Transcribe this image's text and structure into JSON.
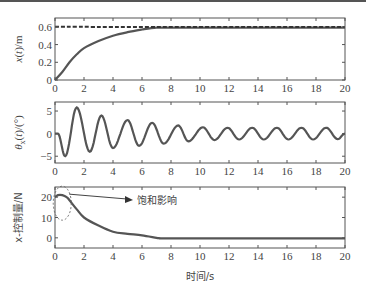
{
  "chart_data": [
    {
      "type": "line",
      "title": "",
      "xlabel": "",
      "ylabel": "x(t)/m",
      "xlim": [
        0,
        20
      ],
      "ylim": [
        0,
        0.7
      ],
      "xticks": [
        "0",
        "2",
        "4",
        "6",
        "8",
        "10",
        "12",
        "14",
        "16",
        "18",
        "20"
      ],
      "yticks": [
        "0",
        "0.2",
        "0.4",
        "0.6"
      ],
      "grid": false,
      "series": [
        {
          "name": "x(t)",
          "style": "solid",
          "x": [
            0,
            0.5,
            1,
            1.5,
            2,
            3,
            4,
            5,
            6,
            7,
            8,
            10,
            12,
            14,
            16,
            18,
            20
          ],
          "y": [
            0,
            0.09,
            0.2,
            0.29,
            0.36,
            0.44,
            0.5,
            0.54,
            0.57,
            0.59,
            0.59,
            0.59,
            0.59,
            0.59,
            0.59,
            0.59,
            0.59
          ]
        },
        {
          "name": "reference",
          "style": "dashed",
          "x": [
            0,
            20
          ],
          "y": [
            0.6,
            0.6
          ]
        }
      ]
    },
    {
      "type": "line",
      "title": "",
      "xlabel": "",
      "ylabel": "θx(t)/(°)",
      "xlim": [
        0,
        20
      ],
      "ylim": [
        -6.5,
        7
      ],
      "xticks": [
        "0",
        "2",
        "4",
        "6",
        "8",
        "10",
        "12",
        "14",
        "16",
        "18",
        "20"
      ],
      "yticks": [
        "-5",
        "0",
        "5"
      ],
      "grid": false,
      "series": [
        {
          "name": "θx(t)",
          "x": [
            0,
            0.2,
            0.7,
            1.5,
            2.4,
            3.2,
            4.0,
            5.0,
            5.8,
            6.7,
            7.5,
            8.5,
            9.2,
            10.2,
            11.0,
            11.9,
            12.7,
            13.6,
            14.4,
            15.3,
            16.1,
            17.0,
            17.8,
            18.7,
            19.5,
            20.0
          ],
          "y": [
            0,
            0,
            -5,
            5.8,
            -4,
            4,
            -3.2,
            3,
            -2.7,
            2.4,
            -2.2,
            1.8,
            -1.7,
            1.4,
            -1.4,
            1.3,
            -1.3,
            1.3,
            -1.3,
            1.3,
            -1.3,
            1.3,
            -1.3,
            1.3,
            -1.2,
            0
          ]
        }
      ]
    },
    {
      "type": "line",
      "title": "",
      "xlabel": "时间/s",
      "ylabel": "x-控制量/N",
      "xlim": [
        0,
        20
      ],
      "ylim": [
        -5,
        25
      ],
      "xticks": [
        "0",
        "2",
        "4",
        "6",
        "8",
        "10",
        "12",
        "14",
        "16",
        "18",
        "20"
      ],
      "yticks": [
        "0",
        "10",
        "20"
      ],
      "grid": false,
      "annotation": {
        "text": "饱和影响",
        "target_x": 0.5,
        "target_y": 20,
        "shape": "dashed-ellipse-with-arrow"
      },
      "series": [
        {
          "name": "x-control",
          "x": [
            0,
            0.2,
            0.5,
            0.8,
            1.0,
            1.5,
            2,
            3,
            4,
            5,
            6,
            7,
            7.3,
            8,
            10,
            12,
            14,
            16,
            18,
            20
          ],
          "y": [
            20,
            21,
            21,
            20,
            18.5,
            14,
            10,
            6,
            3,
            2,
            1.2,
            0,
            -0.3,
            -0.3,
            -0.3,
            -0.3,
            -0.3,
            -0.3,
            -0.3,
            -0.3
          ]
        }
      ]
    }
  ],
  "labels": {
    "plot1_ylabel": "x(t)/m",
    "plot2_ylabel": "θx(t)/(°)",
    "plot3_ylabel": "x-控制量/N",
    "xlabel": "时间/s",
    "annotation": "饱和影响"
  }
}
